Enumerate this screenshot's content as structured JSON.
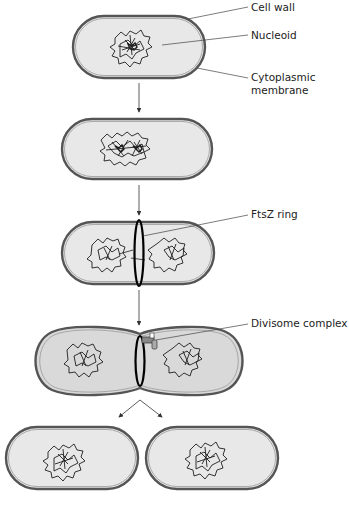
{
  "figure": {
    "colors": {
      "background": "#ffffff",
      "cell_fill": "#e8e8e8",
      "cell_fill_dividing": "#d9d9d9",
      "outline": "#555555",
      "nucleoid": "#1e1e1e",
      "ring": "#000000",
      "leader": "#444444"
    },
    "labels": {
      "cell_wall": "Cell wall",
      "nucleoid": "Nucleoid",
      "cytoplasmic_membrane_1": "Cytoplasmic",
      "cytoplasmic_membrane_2": "membrane",
      "ftsz_ring": "FtsZ ring",
      "divisome_complex": "Divisome complex"
    },
    "stages": [
      {
        "id": 1,
        "description": "Single cell with one nucleoid"
      },
      {
        "id": 2,
        "description": "Replicated nucleoid in elongated cell"
      },
      {
        "id": 3,
        "description": "FtsZ ring forms at midcell"
      },
      {
        "id": 4,
        "description": "Divisome complex constricts cell"
      },
      {
        "id": 5,
        "description": "Two daughter cells"
      }
    ],
    "caption": ""
  }
}
